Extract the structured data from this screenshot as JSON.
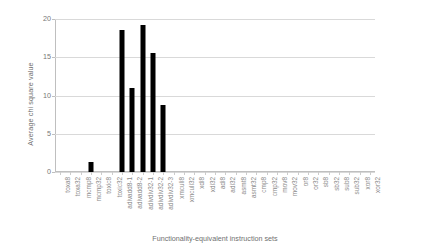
{
  "chart_data": {
    "type": "bar",
    "title": "",
    "xlabel": "Functionality-equivalent instruction sets",
    "ylabel": "Average chi square value",
    "ylim": [
      0,
      20
    ],
    "yticks": [
      0,
      5,
      10,
      15,
      20
    ],
    "grid": true,
    "legend": false,
    "bar_color": "#000000",
    "categories": [
      "toxa8",
      "toxa32",
      "mcmp8",
      "mcmp32",
      "toxic8",
      "toxic32",
      "adivadd8-1",
      "adivadd8-2",
      "adivdiv32-1",
      "adivdiv32-2",
      "adivdiv32-3",
      "xmculi8",
      "xmculi32",
      "xdi8",
      "xdi32",
      "adi8",
      "adi32",
      "asmt8",
      "asmt32",
      "cmp8",
      "cmp32",
      "mov8",
      "mov32",
      "or8",
      "or32",
      "sb8",
      "sb32",
      "sub8",
      "sub32",
      "xor8",
      "xor32"
    ],
    "values": [
      0,
      0,
      0,
      1.3,
      0,
      0,
      18.5,
      11.0,
      19.2,
      15.6,
      8.8,
      0,
      0,
      0,
      0,
      0,
      0,
      0,
      0,
      0,
      0,
      0,
      0,
      0,
      0,
      0,
      0,
      0,
      0,
      0,
      0
    ]
  },
  "axes": {
    "y_title": "Average chi square value",
    "x_title": "Functionality-equivalent instruction sets"
  }
}
